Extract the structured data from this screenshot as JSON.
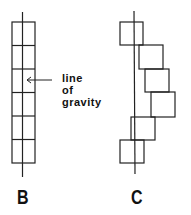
{
  "diagram": {
    "annotation": {
      "line1": "line",
      "line2": "of",
      "line3": "gravity"
    },
    "labels": {
      "b": "B",
      "c": "C"
    },
    "stroke_color": "#222222"
  }
}
